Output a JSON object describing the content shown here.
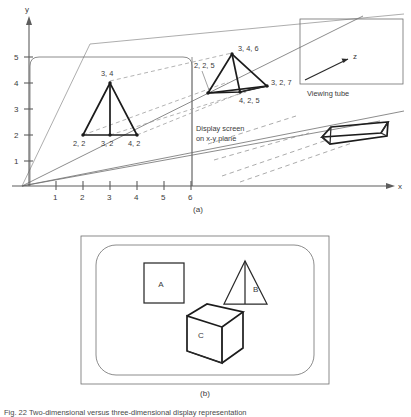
{
  "figure": {
    "caption": "Fig. 22  Two-dimensional versus three-dimensional display representation",
    "panels": [
      {
        "id": "a",
        "label": "(a)"
      },
      {
        "id": "b",
        "label": "(b)"
      }
    ]
  },
  "panel_a": {
    "axes": {
      "x_label": "x",
      "y_label": "y",
      "z_label": "z",
      "x_ticks": [
        "1",
        "2",
        "3",
        "4",
        "5",
        "6"
      ],
      "y_ticks": [
        "1",
        "2",
        "3",
        "4",
        "5"
      ]
    },
    "annotations": {
      "viewing_tube": "Viewing tube",
      "display_screen_line1": "Display screen",
      "display_screen_line2": "on x-y plane"
    },
    "triangle_2d": {
      "name": "two-dimensional triangle on display screen",
      "vertex_labels": {
        "apex": "3, 4",
        "bottom_left": "2, 2",
        "bottom_mid": "3, 2",
        "bottom_right": "4, 2"
      }
    },
    "tetrahedron_3d": {
      "name": "three-dimensional tetrahedron in viewing tube",
      "vertex_labels": {
        "apex": "3, 4, 6",
        "left": "2, 2, 5",
        "right": "3, 2, 7",
        "front": "4, 2, 5"
      }
    },
    "prism_object": {
      "name": "elongated triangular prism"
    }
  },
  "panel_b": {
    "shapes": [
      {
        "id": "A",
        "label": "A",
        "kind": "square"
      },
      {
        "id": "B",
        "label": "B",
        "kind": "triangle"
      },
      {
        "id": "C",
        "label": "C",
        "kind": "cube"
      }
    ]
  }
}
